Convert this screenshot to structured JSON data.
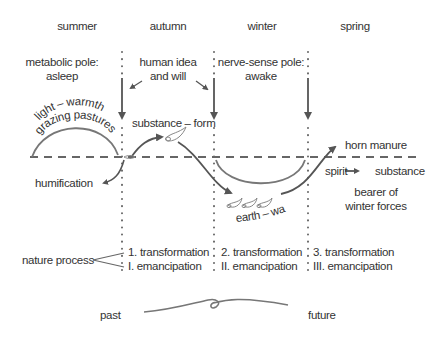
{
  "seasons": [
    "summer",
    "autumn",
    "winter",
    "spring"
  ],
  "poles": {
    "metabolic": [
      "metabolic pole:",
      "asleep"
    ],
    "human": [
      "human idea",
      "and will"
    ],
    "nerve_sense": [
      "nerve-sense pole:",
      "awake"
    ]
  },
  "curve_labels": {
    "light_warmth": "light – warmth",
    "grazing_pastures": "grazing pastures",
    "humification": "humification",
    "substance_form": "substance – form",
    "earth_water": "earth – water",
    "horn_manure": "horn manure",
    "spirit": "spirit",
    "substance": "substance",
    "bearer_line1": "bearer of",
    "bearer_line2": "winter forces"
  },
  "nature_process": {
    "label": "nature process",
    "columns": [
      {
        "transformation": "1. transformation",
        "emancipation": "I. emancipation"
      },
      {
        "transformation": "2. transformation",
        "emancipation": "II. emancipation"
      },
      {
        "transformation": "3.  transformation",
        "emancipation": "III. emancipation"
      }
    ]
  },
  "timeline": {
    "past": "past",
    "future": "future"
  },
  "colors": {
    "line": "#555555",
    "text": "#333333",
    "horn": "#999999"
  }
}
